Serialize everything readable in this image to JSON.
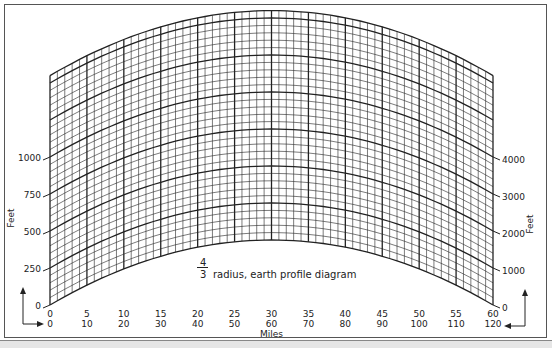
{
  "title": {
    "numerator": "4",
    "denominator": "3",
    "text": "radius, earth profile diagram"
  },
  "left_axis": {
    "label": "Feet",
    "ticks": [
      "0",
      "250",
      "500",
      "750",
      "1000"
    ],
    "values": [
      0,
      250,
      500,
      750,
      1000
    ]
  },
  "right_axis": {
    "label": "Feet",
    "ticks": [
      "0",
      "1000",
      "2000",
      "3000",
      "4000"
    ],
    "values": [
      0,
      1000,
      2000,
      3000,
      4000
    ]
  },
  "x_axis": {
    "label": "Miles",
    "row1": [
      "0",
      "5",
      "10",
      "15",
      "20",
      "25",
      "30",
      "35",
      "40",
      "45",
      "50",
      "55",
      "60"
    ],
    "row2": [
      "0",
      "10",
      "20",
      "30",
      "40",
      "50",
      "60",
      "70",
      "80",
      "90",
      "100",
      "110",
      "120"
    ]
  },
  "grid": {
    "miles_min": 0,
    "miles_max": 60,
    "mile_step": 1,
    "mile_major": 5,
    "feet_max": 1550,
    "feet_step": 50,
    "feet_major": 250
  },
  "colors": {
    "line": "#222222",
    "frame": "#555555"
  }
}
